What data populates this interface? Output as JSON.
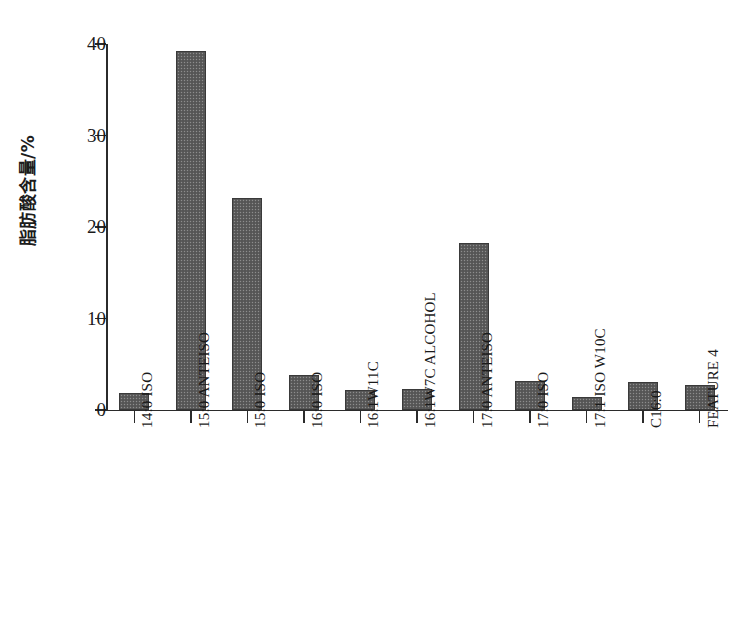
{
  "chart_data": {
    "type": "bar",
    "title": "",
    "subtitle": "",
    "xlabel": "",
    "ylabel": "脂肪酸含量/%",
    "ylim": [
      0,
      40
    ],
    "ytick_labels": [
      "0",
      "10",
      "20",
      "30",
      "40"
    ],
    "ytick_values": [
      0,
      10,
      20,
      30,
      40
    ],
    "grid": false,
    "legend": null,
    "categories": [
      "14:0 ISO",
      "15:0 ANTEISO",
      "15:0 ISO",
      "16:0 ISO",
      "16:1W11C",
      "16:1W7C ALCOHOL",
      "17:0 ANTEISO",
      "17:0 ISO",
      "17:1 ISO W10C",
      "C16:0",
      "FEATURE 4"
    ],
    "values": [
      1.9,
      39.2,
      23.2,
      3.8,
      2.2,
      2.3,
      18.3,
      3.2,
      1.4,
      3.1,
      2.7
    ],
    "bar_color": "#5c5c5c",
    "bar_edge_color": "#3a3a3a",
    "axis_color": "#2b2b2b"
  },
  "figure": {
    "background": "#ffffff",
    "axis_name": "fatty-acid-composition-bar-chart"
  }
}
